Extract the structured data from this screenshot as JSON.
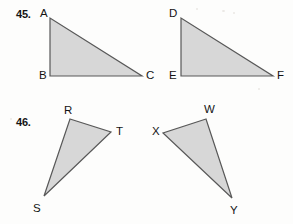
{
  "page": {
    "background_color": "#fdfdfc",
    "width": 293,
    "height": 224
  },
  "style": {
    "triangle_fill": "#d7d7d7",
    "triangle_stroke": "#585858",
    "label_color": "#141414"
  },
  "problems": [
    {
      "number": "45.",
      "figures": [
        {
          "name": "triangle-abc",
          "vertices": [
            {
              "label": "A",
              "x": 50,
              "y": 18
            },
            {
              "label": "B",
              "x": 50,
              "y": 76
            },
            {
              "label": "C",
              "x": 142,
              "y": 76
            }
          ]
        },
        {
          "name": "triangle-def",
          "vertices": [
            {
              "label": "D",
              "x": 181,
              "y": 18
            },
            {
              "label": "E",
              "x": 181,
              "y": 76
            },
            {
              "label": "F",
              "x": 273,
              "y": 76
            }
          ]
        }
      ]
    },
    {
      "number": "46.",
      "figures": [
        {
          "name": "triangle-rst",
          "vertices": [
            {
              "label": "R",
              "x": 70,
              "y": 119
            },
            {
              "label": "T",
              "x": 111,
              "y": 132
            },
            {
              "label": "S",
              "x": 44,
              "y": 196
            }
          ]
        },
        {
          "name": "triangle-wxy",
          "vertices": [
            {
              "label": "W",
              "x": 206,
              "y": 119
            },
            {
              "label": "X",
              "x": 163,
              "y": 133
            },
            {
              "label": "Y",
              "x": 232,
              "y": 198
            }
          ]
        }
      ]
    }
  ],
  "labels": {
    "A": "A",
    "B": "B",
    "C": "C",
    "D": "D",
    "E": "E",
    "F": "F",
    "R": "R",
    "S": "S",
    "T": "T",
    "W": "W",
    "X": "X",
    "Y": "Y",
    "n45": "45.",
    "n46": "46."
  }
}
